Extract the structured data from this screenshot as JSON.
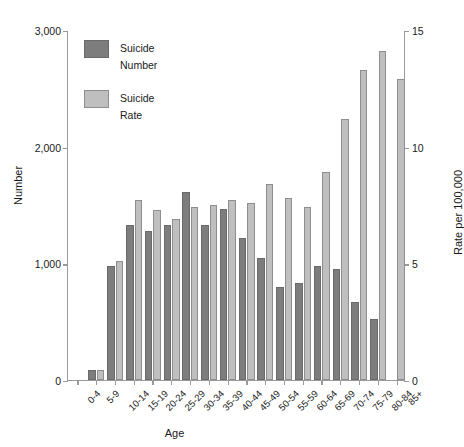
{
  "chart_data": {
    "type": "bar",
    "title": "",
    "xlabel": "Age",
    "ylabel": "Number",
    "y2label": "Rate per 100,000",
    "grid": false,
    "legend_position": "top-left",
    "ylim": [
      0,
      3000
    ],
    "y2lim": [
      0,
      15
    ],
    "yticks": [
      "0",
      "1,000",
      "2,000",
      "3,000"
    ],
    "ytick_values": [
      0,
      1000,
      2000,
      3000
    ],
    "y2ticks": [
      "0",
      "5",
      "10",
      "15"
    ],
    "y2tick_values": [
      0,
      5,
      10,
      15
    ],
    "categories": [
      "0-4",
      "5-9",
      "10-14",
      "15-19",
      "20-24",
      "25-29",
      "30-34",
      "35-39",
      "40-44",
      "45-49",
      "50-54",
      "55-59",
      "60-64",
      "65-69",
      "70-74",
      "75-79",
      "80-84",
      "85+"
    ],
    "series": [
      {
        "name": "Suicide Number",
        "color": "#7d7d7d",
        "axis": "left",
        "values": [
          0,
          85,
          980,
          1330,
          1280,
          1330,
          1610,
          1330,
          1470,
          1220,
          1050,
          800,
          830,
          980,
          950,
          670,
          520,
          0
        ]
      },
      {
        "name": "Suicide Rate",
        "color": "#bfbfbf",
        "axis": "right",
        "values": [
          0,
          0.45,
          5.1,
          7.7,
          7.3,
          6.9,
          7.4,
          7.5,
          7.7,
          7.6,
          8.4,
          7.8,
          7.4,
          8.9,
          11.2,
          13.3,
          14.1,
          12.9
        ]
      }
    ],
    "legend": [
      {
        "label_line1": "Suicide",
        "label_line2": "Number",
        "swatch": "number"
      },
      {
        "label_line1": "Suicide",
        "label_line2": "Rate",
        "swatch": "rate"
      }
    ]
  }
}
